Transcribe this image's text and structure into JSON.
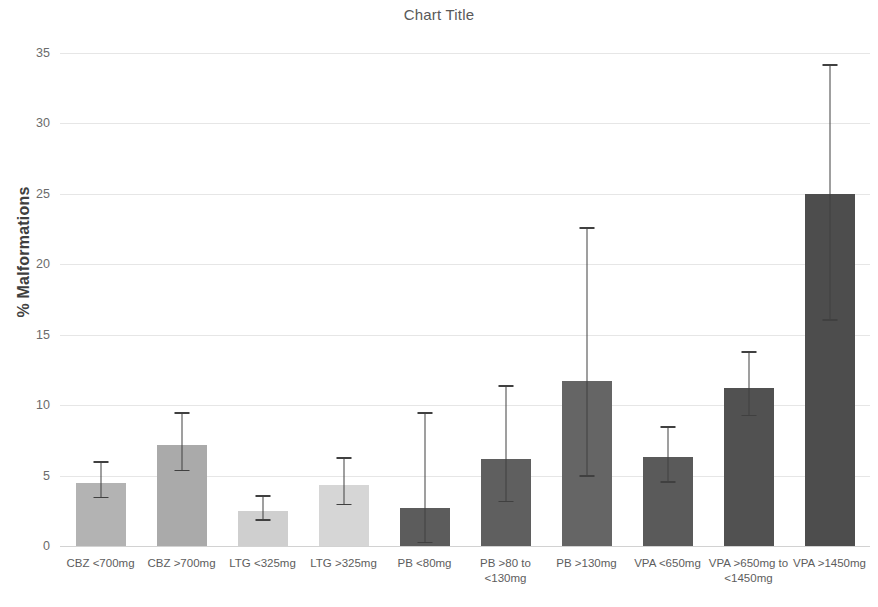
{
  "chart_data": {
    "type": "bar",
    "title": "Chart Title",
    "xlabel": "",
    "ylabel": "% Malformations",
    "ylim": [
      0,
      35
    ],
    "yticks": [
      0,
      5,
      10,
      15,
      20,
      25,
      30,
      35
    ],
    "grid": true,
    "legend": "none",
    "categories": [
      "CBZ <700mg",
      "CBZ >700mg",
      "LTG <325mg",
      "LTG >325mg",
      "PB <80mg",
      "PB >80 to <130mg",
      "PB >130mg",
      "VPA <650mg",
      "VPA >650mg to <1450mg",
      "VPA >1450mg"
    ],
    "values": [
      4.5,
      7.2,
      2.5,
      4.3,
      2.7,
      6.2,
      11.7,
      6.3,
      11.2,
      25.0
    ],
    "error_upper": [
      5.9,
      9.4,
      3.5,
      6.2,
      9.4,
      11.3,
      22.5,
      8.4,
      13.7,
      34.1
    ],
    "error_lower": [
      3.4,
      5.3,
      1.8,
      2.9,
      0.2,
      3.1,
      4.9,
      4.5,
      9.2,
      16.0
    ],
    "bar_colors": [
      "#b3b3b3",
      "#aaaaaa",
      "#cfcfcf",
      "#d6d6d6",
      "#5c5c5c",
      "#5f5f5f",
      "#656565",
      "#5a5a5a",
      "#515151",
      "#4d4d4d"
    ],
    "error_color": "#404040",
    "gridline_color": "#e6e6e6",
    "axis_color": "#d2d2d2",
    "title_color": "#595959",
    "tick_color": "#6b6b6b"
  }
}
